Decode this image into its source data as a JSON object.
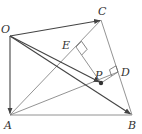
{
  "diagram": {
    "points": {
      "O": {
        "label": "O",
        "x": 10,
        "y": 36
      },
      "C": {
        "label": "C",
        "x": 101,
        "y": 20
      },
      "A": {
        "label": "A",
        "x": 10,
        "y": 115
      },
      "B": {
        "label": "B",
        "x": 132,
        "y": 115
      },
      "P": {
        "label": "P",
        "x": 101,
        "y": 83
      },
      "D": {
        "label": "D",
        "x": 118,
        "y": 72
      },
      "E": {
        "label": "E",
        "x": 76,
        "y": 47
      }
    },
    "colors": {
      "line": "#666666",
      "vector": "#444444",
      "dot": "#333333"
    }
  }
}
